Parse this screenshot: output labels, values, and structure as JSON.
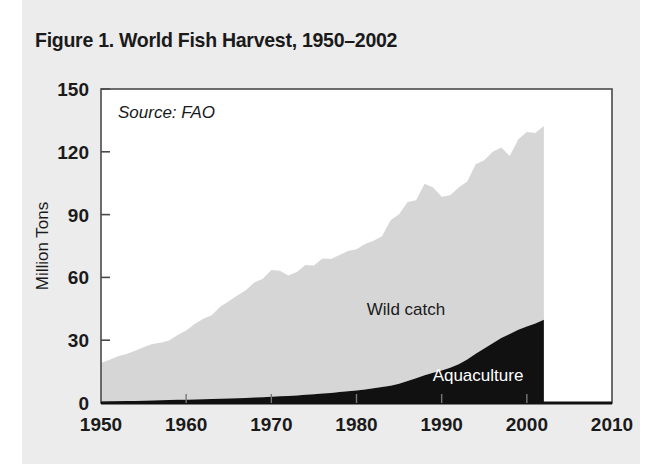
{
  "figure": {
    "title": "Figure 1. World Fish Harvest, 1950–2002",
    "source_note": "Source: FAO"
  },
  "colors": {
    "page_background": "#ececec",
    "plot_background": "#ffffff",
    "frame": "#4a4a4a",
    "wild_catch_fill": "#d6d6d6",
    "aquaculture_fill": "#111111",
    "text": "#1a1a1a",
    "label_on_dark": "#ffffff"
  },
  "chart_data": {
    "type": "area",
    "stacked": true,
    "title": "Figure 1. World Fish Harvest, 1950–2002",
    "xlabel": "",
    "ylabel": "Million Tons",
    "xlim": [
      1950,
      2010
    ],
    "ylim": [
      0,
      150
    ],
    "xticks": [
      1950,
      1960,
      1970,
      1980,
      1990,
      2000,
      2010
    ],
    "yticks": [
      0,
      30,
      60,
      90,
      120,
      150
    ],
    "grid": false,
    "legend": "inline-labels",
    "annotations": [
      {
        "text": "Source: FAO",
        "x": 1953,
        "y": 140
      },
      {
        "text": "Wild catch",
        "x": 1988,
        "y": 45
      },
      {
        "text": "Aquaculture",
        "x": 1995,
        "y": 11
      }
    ],
    "x": [
      1950,
      1951,
      1952,
      1953,
      1954,
      1955,
      1956,
      1957,
      1958,
      1959,
      1960,
      1961,
      1962,
      1963,
      1964,
      1965,
      1966,
      1967,
      1968,
      1969,
      1970,
      1971,
      1972,
      1973,
      1974,
      1975,
      1976,
      1977,
      1978,
      1979,
      1980,
      1981,
      1982,
      1983,
      1984,
      1985,
      1986,
      1987,
      1988,
      1989,
      1990,
      1991,
      1992,
      1993,
      1994,
      1995,
      1996,
      1997,
      1998,
      1999,
      2000,
      2001,
      2002
    ],
    "series": [
      {
        "name": "Aquaculture",
        "values": [
          0.6,
          0.7,
          0.8,
          0.9,
          1.0,
          1.1,
          1.2,
          1.3,
          1.4,
          1.5,
          1.6,
          1.7,
          1.8,
          1.9,
          2.0,
          2.1,
          2.3,
          2.4,
          2.6,
          2.8,
          3.0,
          3.2,
          3.4,
          3.6,
          3.9,
          4.2,
          4.5,
          4.8,
          5.2,
          5.6,
          6.0,
          6.5,
          7.0,
          7.6,
          8.3,
          9.2,
          10.5,
          11.8,
          13.2,
          14.5,
          15.5,
          16.8,
          18.5,
          20.8,
          23.5,
          26.0,
          28.5,
          31.0,
          33.0,
          35.0,
          36.5,
          38.0,
          39.8
        ]
      },
      {
        "name": "Wild catch",
        "values": [
          18.5,
          20.0,
          21.5,
          22.5,
          24.0,
          25.5,
          27.0,
          27.5,
          28.5,
          31.0,
          33.0,
          36.0,
          38.5,
          40.0,
          44.0,
          46.5,
          49.0,
          51.5,
          55.0,
          56.5,
          60.5,
          60.0,
          57.5,
          59.0,
          62.0,
          61.5,
          64.5,
          64.0,
          65.5,
          67.0,
          67.5,
          69.5,
          70.5,
          72.0,
          79.0,
          81.0,
          85.5,
          85.0,
          91.5,
          88.5,
          83.0,
          82.5,
          84.5,
          85.0,
          90.5,
          90.0,
          91.5,
          91.0,
          85.0,
          91.0,
          93.0,
          91.0,
          92.5
        ]
      }
    ],
    "totals_note_peak": 132.3
  }
}
